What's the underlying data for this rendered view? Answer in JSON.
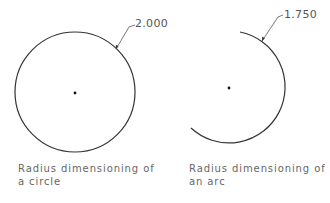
{
  "figures": [
    {
      "name": "circle",
      "dimension_label": "2.000",
      "caption_line1": "Radius dimensioning of",
      "caption_line2": "a circle"
    },
    {
      "name": "arc",
      "dimension_label": "1.750",
      "caption_line1": "Radius dimensioning of",
      "caption_line2": "an arc"
    }
  ],
  "colors": {
    "line": "#333333",
    "text": "#555555",
    "background": "#ffffff"
  }
}
